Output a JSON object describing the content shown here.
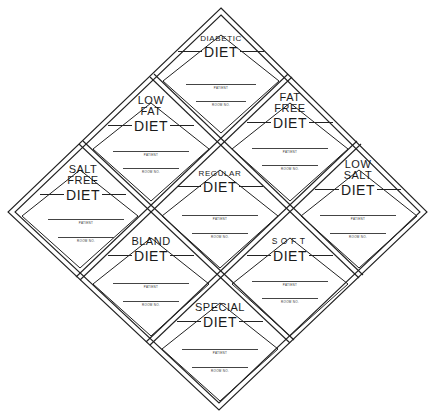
{
  "sheet": {
    "description": "Nine diamond-shaped hospital diet labels arranged in a larger diamond",
    "line_color": "#222222",
    "background": "#ffffff"
  },
  "labels": [
    {
      "id": "diabetic",
      "title_lines": [
        "DIABETIC"
      ],
      "diet": "DIET",
      "patient_label": "PATIENT",
      "room_label": "ROOM NO."
    },
    {
      "id": "low-fat",
      "title_lines": [
        "LOW",
        "FAT"
      ],
      "diet": "DIET",
      "patient_label": "PATIENT",
      "room_label": "ROOM NO."
    },
    {
      "id": "fat-free",
      "title_lines": [
        "FAT",
        "FREE"
      ],
      "diet": "DIET",
      "patient_label": "PATIENT",
      "room_label": "ROOM NO."
    },
    {
      "id": "salt-free",
      "title_lines": [
        "SALT",
        "FREE"
      ],
      "diet": "DIET",
      "patient_label": "PATIENT",
      "room_label": "ROOM NO."
    },
    {
      "id": "regular",
      "title_lines": [
        "REGULAR"
      ],
      "diet": "DIET",
      "patient_label": "PATIENT",
      "room_label": "ROOM NO."
    },
    {
      "id": "low-salt",
      "title_lines": [
        "LOW",
        "SALT"
      ],
      "diet": "DIET",
      "patient_label": "PATIENT",
      "room_label": "ROOM NO."
    },
    {
      "id": "bland",
      "title_lines": [
        "BLAND"
      ],
      "diet": "DIET",
      "patient_label": "PATIENT",
      "room_label": "ROOM NO."
    },
    {
      "id": "soft",
      "title_lines": [
        "SOFT"
      ],
      "diet": "DIET",
      "patient_label": "PATIENT",
      "room_label": "ROOM NO."
    },
    {
      "id": "special",
      "title_lines": [
        "SPECIAL"
      ],
      "diet": "DIET",
      "patient_label": "PATIENT",
      "room_label": "ROOM NO."
    }
  ]
}
